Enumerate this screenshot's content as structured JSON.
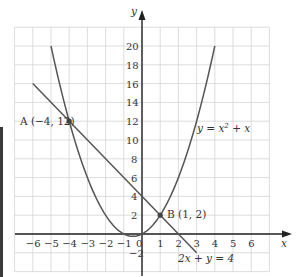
{
  "chart_data": {
    "type": "line",
    "title": "",
    "xlabel": "x",
    "ylabel": "y",
    "xlim": [
      -7,
      7
    ],
    "ylim": [
      -4,
      22
    ],
    "grid": true,
    "x_ticks": [
      -6,
      -5,
      -4,
      -3,
      -2,
      -1,
      0,
      1,
      2,
      3,
      4,
      5,
      6
    ],
    "y_ticks": [
      -2,
      2,
      4,
      6,
      8,
      10,
      12,
      14,
      16,
      18,
      20
    ],
    "series": [
      {
        "name": "y = x² + x",
        "kind": "parabola",
        "equation": "y = x^2 + x",
        "x_range": [
          -5,
          4
        ],
        "x": [
          -5,
          -4,
          -3,
          -2,
          -1,
          -0.5,
          0,
          1,
          2,
          3,
          4
        ],
        "y": [
          20,
          12,
          6,
          2,
          0,
          -0.25,
          0,
          2,
          6,
          12,
          20
        ]
      },
      {
        "name": "2x + y = 4",
        "kind": "line",
        "equation": "y = 4 - 2x",
        "x_range": [
          -6,
          3
        ],
        "x": [
          -6,
          -4,
          0,
          1,
          2,
          3
        ],
        "y": [
          16,
          12,
          4,
          2,
          0,
          -2
        ]
      }
    ],
    "points": [
      {
        "name": "A",
        "label": "A (−4, 12)",
        "x": -4,
        "y": 12
      },
      {
        "name": "B",
        "label": "B (1, 2)",
        "x": 1,
        "y": 2
      }
    ],
    "annotations": [
      {
        "text_prefix": "y = x",
        "sup": "2",
        "text_suffix": " + x",
        "x": 4.6,
        "y": 10.9
      },
      {
        "text": "2x + y = 4",
        "x": 2.0,
        "y": -2.9
      }
    ]
  },
  "labels": {
    "x_axis": "x",
    "y_axis": "y",
    "origin": "0",
    "point_a": "A (−4, 12)",
    "point_b": "B (1, 2)",
    "curve_label_prefix": "y = x",
    "curve_label_sup": "2",
    "curve_label_suffix": " + x",
    "line_label": "2x + y = 4"
  },
  "colors": {
    "grid": "#d4d4d4",
    "axis": "#222222",
    "curve": "#555555",
    "text": "#333333"
  }
}
